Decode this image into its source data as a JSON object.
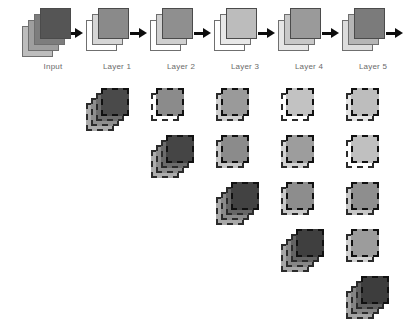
{
  "figure": {
    "background_color": "#ffffff",
    "arrow_color": "#0d0d0d",
    "label_color": "#6a6a6a"
  },
  "flow": {
    "nodes": [
      {
        "id": "input",
        "label": "Input",
        "x": 22,
        "y": 8,
        "depth": 4,
        "front_color": "#555555",
        "back_colors": [
          "#7d7d7d",
          "#9e9e9e",
          "#bdbdbd"
        ],
        "arrow_after": true
      },
      {
        "id": "layer1",
        "label": "Layer 1",
        "x": 86,
        "y": 8,
        "depth": 3,
        "front_color": "#8a8a8a",
        "back_colors": [
          "#d6d6d6",
          "#ffffff"
        ],
        "arrow_after": true
      },
      {
        "id": "layer2",
        "label": "Layer 2",
        "x": 150,
        "y": 8,
        "depth": 3,
        "front_color": "#8f8f8f",
        "back_colors": [
          "#d0d0d0",
          "#ffffff"
        ],
        "arrow_after": true
      },
      {
        "id": "layer3",
        "label": "Layer 3",
        "x": 214,
        "y": 8,
        "depth": 3,
        "front_color": "#bcbcbc",
        "back_colors": [
          "#e8e8e8",
          "#ffffff"
        ],
        "arrow_after": true
      },
      {
        "id": "layer4",
        "label": "Layer 4",
        "x": 278,
        "y": 8,
        "depth": 3,
        "front_color": "#9a9a9a",
        "back_colors": [
          "#c8c8c8",
          "#e6e6e6"
        ],
        "arrow_after": true
      },
      {
        "id": "layer5",
        "label": "Layer 5",
        "x": 342,
        "y": 8,
        "depth": 3,
        "front_color": "#7b7b7b",
        "back_colors": [
          "#b5b5b5",
          "#dcdcdc"
        ],
        "arrow_after": true
      }
    ],
    "arrow_positions": [
      {
        "x": 66,
        "y": 28
      },
      {
        "x": 130,
        "y": 28
      },
      {
        "x": 194,
        "y": 28
      },
      {
        "x": 258,
        "y": 28
      },
      {
        "x": 322,
        "y": 28
      },
      {
        "x": 386,
        "y": 28
      }
    ]
  },
  "feature_grid": {
    "description": "Lower-triangular grid of feature-map stacks beneath each layer",
    "column_x": [
      86,
      151,
      216,
      281,
      346
    ],
    "row_y": [
      88,
      135,
      182,
      229,
      276
    ],
    "columns": [
      {
        "column": 1,
        "layer": "Layer 1",
        "stacks": [
          {
            "row": 1,
            "depth": 4,
            "front_color": "#4a4a4a",
            "back_colors": [
              "#6e6e6e",
              "#8e8e8e",
              "#ababab"
            ]
          }
        ]
      },
      {
        "column": 2,
        "layer": "Layer 2",
        "stacks": [
          {
            "row": 1,
            "depth": 2,
            "front_color": "#8b8b8b",
            "back_colors": [
              "#ffffff"
            ]
          },
          {
            "row": 2,
            "depth": 4,
            "front_color": "#454545",
            "back_colors": [
              "#6b6b6b",
              "#8c8c8c",
              "#adadad"
            ]
          }
        ]
      },
      {
        "column": 3,
        "layer": "Layer 3",
        "stacks": [
          {
            "row": 1,
            "depth": 2,
            "front_color": "#9a9a9a",
            "back_colors": [
              "#cfcfcf"
            ]
          },
          {
            "row": 2,
            "depth": 2,
            "front_color": "#8b8b8b",
            "back_colors": [
              "#c6c6c6"
            ]
          },
          {
            "row": 3,
            "depth": 4,
            "front_color": "#424242",
            "back_colors": [
              "#666666",
              "#8a8a8a",
              "#a8a8a8"
            ]
          }
        ]
      },
      {
        "column": 4,
        "layer": "Layer 4",
        "stacks": [
          {
            "row": 1,
            "depth": 2,
            "front_color": "#c2c2c2",
            "back_colors": [
              "#ffffff"
            ]
          },
          {
            "row": 2,
            "depth": 2,
            "front_color": "#9d9d9d",
            "back_colors": [
              "#d2d2d2"
            ]
          },
          {
            "row": 3,
            "depth": 2,
            "front_color": "#8d8d8d",
            "back_colors": [
              "#c9c9c9"
            ]
          },
          {
            "row": 4,
            "depth": 4,
            "front_color": "#3f3f3f",
            "back_colors": [
              "#636363",
              "#878787",
              "#a6a6a6"
            ]
          }
        ]
      },
      {
        "column": 5,
        "layer": "Layer 5",
        "stacks": [
          {
            "row": 1,
            "depth": 2,
            "front_color": "#bdbdbd",
            "back_colors": [
              "#e4e4e4"
            ]
          },
          {
            "row": 2,
            "depth": 2,
            "front_color": "#c0c0c0",
            "back_colors": [
              "#ffffff"
            ]
          },
          {
            "row": 3,
            "depth": 2,
            "front_color": "#8e8e8e",
            "back_colors": [
              "#c6c6c6"
            ]
          },
          {
            "row": 4,
            "depth": 2,
            "front_color": "#9c9c9c",
            "back_colors": [
              "#d0d0d0"
            ]
          },
          {
            "row": 5,
            "depth": 4,
            "front_color": "#3d3d3d",
            "back_colors": [
              "#606060",
              "#848484",
              "#a4a4a4"
            ]
          }
        ]
      }
    ]
  }
}
